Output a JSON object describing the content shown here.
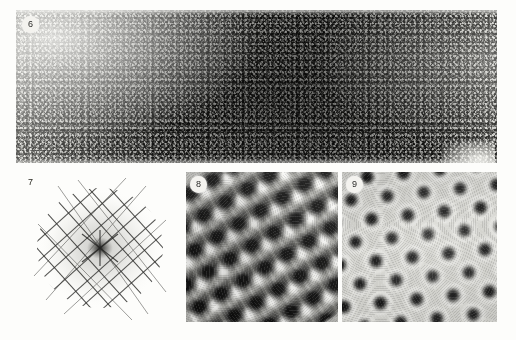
{
  "figure": {
    "kind": "electron-micrograph-plate",
    "background_color": "#fdfdfb",
    "panel_count": 4
  },
  "panels": [
    {
      "id": "panel-6",
      "label": "6",
      "label_style": "circled-badge",
      "description": "Wide low-dose electron micrograph of a thin crystalline specimen; fine granular worm-like contrast, brighter at upper-left, darker through the centre, with a pale support-film hole at the lower right.",
      "geometry": {
        "x": 16,
        "y": 10,
        "width": 481,
        "height": 153
      },
      "tone": {
        "mean": "#8a8a86",
        "light": "#e8e8e2",
        "dark": "#1a1a18"
      }
    },
    {
      "id": "panel-7",
      "label": "7",
      "label_style": "plain-text",
      "description": "Optical diffractogram (Fourier transform) of the micrograph: a pale circular disc crossed by two families of fine dark parallel lines intersecting near 90 degrees, with a dark starburst central spot.",
      "geometry": {
        "x": 20,
        "y": 172,
        "width": 160,
        "height": 152
      },
      "tone": {
        "background": "#fdfdfb",
        "lines": "#3a3a38",
        "center_spot": "#232321"
      },
      "pattern": {
        "line_family_angles_deg": [
          48,
          -42
        ],
        "line_spacing_px": 15.5,
        "lines_per_family": 11,
        "disc_center": {
          "x": 100,
          "y": 248
        },
        "disc_radius_px": 62
      }
    },
    {
      "id": "panel-8",
      "label": "8",
      "label_style": "circled-badge",
      "description": "Filtered/reconstructed lattice image showing strongly contrasted dark motifs arranged in oblique rows running from upper-left to lower-right, each flanked by bright halos.",
      "geometry": {
        "x": 186,
        "y": 172,
        "width": 152,
        "height": 150
      },
      "tone": {
        "mean": "#b2b2ae",
        "light": "#fbfbf8",
        "dark": "#080808"
      },
      "pattern": {
        "lattice_rotation_deg": -31,
        "repeat_px": 25.5,
        "symmetry": "oblique"
      }
    },
    {
      "id": "panel-9",
      "label": "9",
      "label_style": "circled-badge",
      "description": "Averaged lattice image with a lighter, more regular array of dark dots, each surrounded by a bright ring halo, on a pale grey background.",
      "geometry": {
        "x": 342,
        "y": 172,
        "width": 155,
        "height": 150
      },
      "tone": {
        "mean": "#d2d2cd",
        "light": "#fcfcf9",
        "dark": "#0c0c0c"
      },
      "pattern": {
        "lattice_rotation_deg": -6,
        "repeat_x_px": 36.5,
        "repeat_y_px": 42.2,
        "symmetry": "hexagonal"
      }
    }
  ]
}
